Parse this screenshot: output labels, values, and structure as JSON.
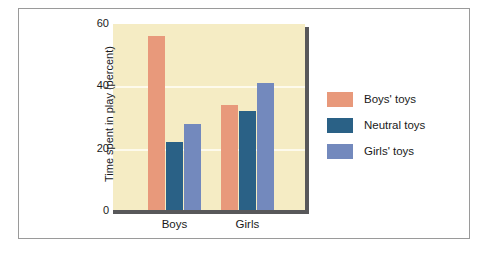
{
  "chart_data": {
    "type": "bar",
    "title": "",
    "xlabel": "",
    "ylabel": "Time spent in play (percent)",
    "categories": [
      "Boys",
      "Girls"
    ],
    "series": [
      {
        "name": "Boys' toys",
        "values": [
          56,
          34
        ],
        "color": "#e8997b"
      },
      {
        "name": "Neutral toys",
        "values": [
          22,
          32
        ],
        "color": "#2a6186"
      },
      {
        "name": "Girls' toys",
        "values": [
          28,
          41
        ],
        "color": "#7389bd"
      }
    ],
    "ylim": [
      0,
      60
    ],
    "yticks": [
      0,
      20,
      40,
      60
    ],
    "ytick_labels": [
      "0",
      "20",
      "40",
      "60"
    ],
    "grid": true,
    "grid_color": "#fdfaec",
    "legend_position": "right",
    "plot_background": "#f5ecc4",
    "axis_color": "#58585a",
    "frame_color": "#9a9a9a",
    "page_background": "#ffffff"
  },
  "legend": {
    "items": [
      {
        "label": "Boys' toys"
      },
      {
        "label": "Neutral toys"
      },
      {
        "label": "Girls' toys"
      }
    ]
  }
}
